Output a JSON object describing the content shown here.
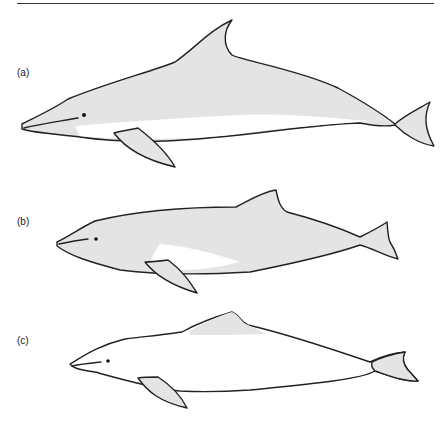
{
  "figure": {
    "panels": [
      {
        "label": "(a)",
        "description": "dolphin with tall falcate dorsal fin, shaded body with light belly"
      },
      {
        "label": "(b)",
        "description": "dolphin with low triangular dorsal fin, shaded body with light flank patch"
      },
      {
        "label": "(c)",
        "description": "dolphin with low dorsal fin, mostly unshaded body, shaded fins"
      }
    ],
    "colors": {
      "outline": "#222222",
      "fill": "#e4e4e4",
      "background": "#ffffff"
    }
  }
}
